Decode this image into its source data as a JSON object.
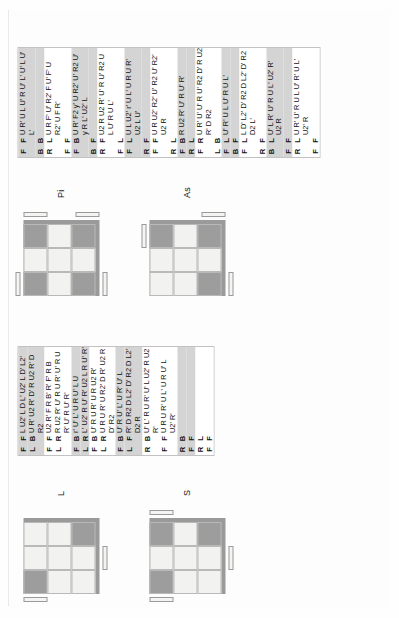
{
  "document": {
    "title": "Rubik's Cube Algorithm Reference Sheet",
    "orientation": "rotated-90-ccw"
  },
  "colors": {
    "sticker_light": "#f2f2f0",
    "sticker_dark": "#9d9d9d",
    "row_shade": "#d4d4d4",
    "row_plain": "#ffffff",
    "grid_line": "#b9b9b9",
    "table_border": "#c2c2c2",
    "text": "#111111"
  },
  "table_headers": {
    "col_a": "face-pair-1",
    "col_b": "face-pair-2",
    "col_alg": "algorithm"
  },
  "cases": [
    {
      "id": "L",
      "label": "L",
      "cube": {
        "cells": [
          "dk",
          "lt",
          "lt",
          "lt",
          "lt",
          "lt",
          "lt",
          "lt",
          "dk"
        ],
        "arrows": [
          {
            "edge": "left",
            "pos": "top"
          },
          {
            "edge": "bottom",
            "pos": "center-right"
          }
        ]
      },
      "rows": [
        {
          "shaded": true,
          "a": "F",
          "b": "F",
          "alg": [
            "L U2' L D L' U2' L D' L2'"
          ]
        },
        {
          "shaded": true,
          "a": "L",
          "b": "B",
          "alg": [
            "U R' U2 R' D' R U2 R' D",
            "R2"
          ]
        },
        {
          "shaded": false,
          "a": "F",
          "b": "F",
          "alg": [
            "U2 R' F R B' R' F' R B"
          ]
        },
        {
          "shaded": false,
          "a": "L",
          "b": "R",
          "alg": [
            "R U2 R' U' R U R' U' R U",
            "R' U' R U' R'"
          ]
        },
        {
          "shaded": true,
          "a": "F",
          "b": "B",
          "alg": [
            "r' U' L' U R U' L U"
          ]
        },
        {
          "shaded": true,
          "a": "L",
          "b": "F",
          "alg": [
            "L' U2' R U' R' U2 L R U' R'"
          ]
        },
        {
          "shaded": false,
          "a": "F",
          "b": "R",
          "alg": [
            "U' R U R' U R U2 R'"
          ]
        },
        {
          "shaded": false,
          "a": "L",
          "b": "F",
          "alg": [
            "U R U R' U R2' D R' U2 R",
            "D' R2"
          ]
        },
        {
          "shaded": true,
          "a": "F",
          "b": "B",
          "alg": [
            "U' R U' L' U R' U' L"
          ]
        },
        {
          "shaded": true,
          "a": "L",
          "b": "R",
          "alg": [
            "R' D R2 D L2' D' R2 D L2'",
            "D2 R"
          ]
        },
        {
          "shaded": false,
          "a": "F",
          "b": "B",
          "alg": [
            "U' L' R U R' U' L U2' R U2",
            "R'"
          ]
        },
        {
          "shaded": false,
          "a": "R",
          "b": "F",
          "alg": [
            "U R U R' U L' U R U' L",
            "U2' R'"
          ]
        }
      ]
    },
    {
      "id": "S",
      "label": "S",
      "cube": {
        "cells": [
          "dk",
          "lt",
          "dk",
          "lt",
          "lt",
          "lt",
          "lt",
          "lt",
          "dk"
        ],
        "arrows": [
          {
            "edge": "left",
            "pos": "top"
          },
          {
            "edge": "right",
            "pos": "top"
          },
          {
            "edge": "bottom",
            "pos": "center-right"
          }
        ]
      },
      "rows": []
    },
    {
      "id": "Pi",
      "label": "Pi",
      "cube": {
        "cells": [
          "dk",
          "lt",
          "dk",
          "lt",
          "lt",
          "lt",
          "dk",
          "lt",
          "dk"
        ],
        "arrows": [
          {
            "edge": "top",
            "pos": "left"
          },
          {
            "edge": "bottom",
            "pos": "left"
          },
          {
            "edge": "right",
            "pos": "top"
          },
          {
            "edge": "right",
            "pos": "bottom"
          }
        ]
      },
      "rows": [
        {
          "shaded": true,
          "a": "F",
          "b": "F",
          "alg": [
            "U R' U L U' R U' L' U' L U'",
            "L'"
          ]
        },
        {
          "shaded": true,
          "a": "B",
          "b": "B",
          "alg": []
        },
        {
          "shaded": false,
          "a": "R",
          "b": "L",
          "alg": [
            "U R F' U' R2' F U' F' U",
            "R2' U F R'"
          ]
        },
        {
          "shaded": false,
          "a": "F",
          "b": "F",
          "alg": []
        },
        {
          "shaded": true,
          "a": "F",
          "b": "B",
          "alg": [
            "U R' F2 y' U R2' U' R2 U'",
            "y R L' U2' L"
          ]
        },
        {
          "shaded": true,
          "a": "B",
          "b": "F",
          "alg": []
        },
        {
          "shaded": false,
          "a": "R",
          "b": "F",
          "alg": [
            "U2 R U2 R' U' R U' R2 U",
            "L U' R U L'"
          ]
        },
        {
          "shaded": false,
          "a": "F",
          "b": "L",
          "alg": []
        },
        {
          "shaded": true,
          "a": "F",
          "b": "L",
          "alg": [
            "U L U2' r' U L' U R U R'",
            "U2 L U'"
          ]
        },
        {
          "shaded": true,
          "a": "R",
          "b": "F",
          "alg": []
        },
        {
          "shaded": false,
          "a": "F",
          "b": "F",
          "alg": [
            "U R U2' R2' U' R2 U' R2'",
            "U2 R"
          ]
        },
        {
          "shaded": false,
          "a": "R",
          "b": "L",
          "alg": []
        },
        {
          "shaded": true,
          "a": "F",
          "b": "B",
          "alg": [
            "R U2 R' U' R U' R'"
          ]
        },
        {
          "shaded": true,
          "a": "R",
          "b": "L",
          "alg": []
        },
        {
          "shaded": false,
          "a": "F",
          "b": "R",
          "alg": [
            "U R' U' U' R U' R2 D' R U2",
            "R' D R2"
          ]
        },
        {
          "shaded": false,
          "a": "L",
          "b": "B",
          "alg": []
        },
        {
          "shaded": true,
          "a": "F",
          "b": "L",
          "alg": [
            "U' R' U L U' R U L'"
          ]
        },
        {
          "shaded": true,
          "a": "B",
          "b": "F",
          "alg": []
        },
        {
          "shaded": false,
          "a": "F",
          "b": "L",
          "alg": [
            "L D' L2' D' R2 D L2' D' R2",
            "D2 L'"
          ]
        },
        {
          "shaded": false,
          "a": "R",
          "b": "F",
          "alg": []
        },
        {
          "shaded": true,
          "a": "B",
          "b": "L",
          "alg": [
            "U' L R' U' R U L' U2' R'",
            "U2 R"
          ]
        },
        {
          "shaded": true,
          "a": "F",
          "b": "F",
          "alg": []
        },
        {
          "shaded": false,
          "a": "R",
          "b": "L",
          "alg": [
            "U R' U' R U L U' R' U L'",
            "U2' R"
          ]
        },
        {
          "shaded": false,
          "a": "F",
          "b": "F",
          "alg": []
        }
      ]
    },
    {
      "id": "As",
      "label": "As",
      "cube": {
        "cells": [
          "lt",
          "lt",
          "dk",
          "lt",
          "lt",
          "lt",
          "dk",
          "lt",
          "dk"
        ],
        "arrows": [
          {
            "edge": "top",
            "pos": "right"
          },
          {
            "edge": "bottom",
            "pos": "left"
          },
          {
            "edge": "right",
            "pos": "bottom"
          }
        ]
      },
      "rows": []
    }
  ],
  "table_L": {
    "rows": [
      {
        "shaded": true,
        "a": "F",
        "b": "F",
        "alg": [
          "L U2' L D L' U2' L D' L2'"
        ]
      },
      {
        "shaded": true,
        "a": "L",
        "b": "B",
        "alg": [
          "U R' U2 R' D' R U2 R' D",
          "R2"
        ]
      },
      {
        "shaded": false,
        "a": "F",
        "b": "F",
        "alg": [
          "U2 R' F R B' R' F' R B"
        ]
      },
      {
        "shaded": false,
        "a": "L",
        "b": "R",
        "alg": [
          "R U2 R' U' R U R' U' R U",
          "R' U' R U' R'"
        ]
      },
      {
        "shaded": true,
        "a": "F",
        "b": "B",
        "alg": [
          "r' U' L' U R U' L U"
        ]
      },
      {
        "shaded": true,
        "a": "L",
        "b": "R",
        "alg": [
          "L' U2' R U' R' U2 L R U' R'"
        ]
      },
      {
        "shaded": false,
        "a": "F",
        "b": "B",
        "alg": [
          "U' R U R' U R U2 R'"
        ]
      },
      {
        "shaded": false,
        "a": "L",
        "b": "R",
        "alg": [
          "U R U R' U R2' D R' U2 R",
          "D' R2"
        ]
      },
      {
        "shaded": true,
        "a": "F",
        "b": "B",
        "alg": [
          "U' R U' L' U R' U' L"
        ]
      },
      {
        "shaded": true,
        "a": "L",
        "b": "F",
        "alg": [
          "R' D R2 D L2' D' R2 D L2'",
          "D2 R"
        ]
      },
      {
        "shaded": false,
        "a": "R",
        "b": "B",
        "alg": [
          "U' L' R U R' U' L U2' R U2",
          "R'"
        ]
      },
      {
        "shaded": false,
        "a": "F",
        "b": "F",
        "alg": [
          "U R U R' U L' U R U' L",
          "U2' R'"
        ]
      },
      {
        "shaded": true,
        "a": "R",
        "b": "B",
        "alg": []
      },
      {
        "shaded": true,
        "a": "F",
        "b": "F",
        "alg": []
      },
      {
        "shaded": false,
        "a": "R",
        "b": "L",
        "alg": []
      },
      {
        "shaded": false,
        "a": "F",
        "b": "F",
        "alg": []
      }
    ]
  },
  "cube_faces_legend": [
    "F",
    "B",
    "R",
    "L",
    "U",
    "D"
  ]
}
